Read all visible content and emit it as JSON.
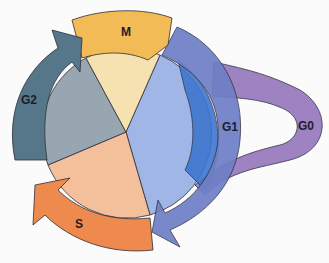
{
  "diagram": {
    "type": "cell-cycle",
    "phases": [
      {
        "id": "M",
        "label": "M",
        "wedge_color": "#f6e2b0",
        "arrow_color": "#f2bb55"
      },
      {
        "id": "G1",
        "label": "G1",
        "wedge_color": "#9fb6e6",
        "arrow_color": "#6f7fc6",
        "inner_band_color": "#3f76cf"
      },
      {
        "id": "S",
        "label": "S",
        "wedge_color": "#f4c09c",
        "arrow_color": "#ef8a4f"
      },
      {
        "id": "G2",
        "label": "G2",
        "wedge_color": "#97a6b0",
        "arrow_color": "#56778a"
      },
      {
        "id": "G0",
        "label": "G0",
        "arrow_color": "#9a7cc0"
      }
    ],
    "background": "#fbfbfb",
    "outline_color": "#2d2d3a"
  }
}
